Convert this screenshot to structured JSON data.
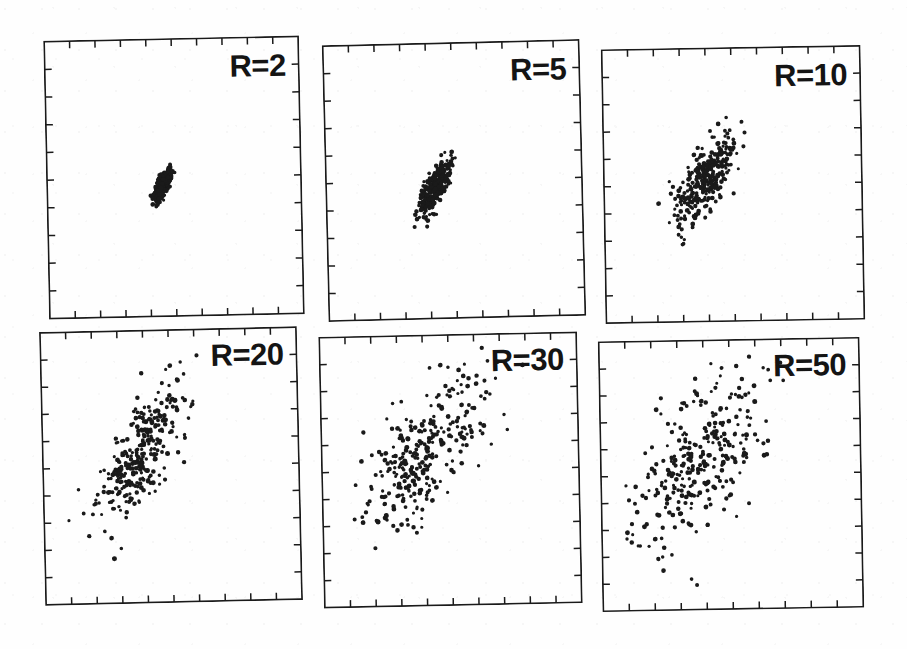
{
  "figure": {
    "title": "",
    "background_color": "#fefefe",
    "ink_color": "#1a1a1a",
    "width": 907,
    "height": 649,
    "rows": 2,
    "columns": 3
  },
  "chart_data": {
    "type": "scatter",
    "title": "",
    "xlabel": "",
    "ylabel": "",
    "grid": false,
    "legend": null,
    "axis_ticks": {
      "x_interior_ticks": 9,
      "y_interior_ticks": 9,
      "tick_direction": "inward",
      "tick_labels": []
    },
    "xlim": [
      0,
      1
    ],
    "ylim": [
      0,
      1
    ],
    "panel_note": "Each panel shows a bivariate correlated cloud of ~300 points centred near the middle of the frame; the scatter spread grows with R while the positive correlation (elongation along the lower-left to upper-right diagonal) is preserved.",
    "panels": [
      {
        "id": "panel-r2",
        "label": "R=2",
        "R": 2,
        "n_points": 300,
        "center": [
          0.455,
          0.47
        ],
        "sigma_x": 0.016,
        "sigma_y": 0.026,
        "correlation": 0.72,
        "tilt_deg": -1.2
      },
      {
        "id": "panel-r5",
        "label": "R=5",
        "R": 5,
        "n_points": 300,
        "center": [
          0.43,
          0.48
        ],
        "sigma_x": 0.033,
        "sigma_y": 0.052,
        "correlation": 0.74,
        "tilt_deg": -1.4
      },
      {
        "id": "panel-r10",
        "label": "R=10",
        "R": 10,
        "n_points": 300,
        "center": [
          0.395,
          0.52
        ],
        "sigma_x": 0.062,
        "sigma_y": 0.085,
        "correlation": 0.76,
        "tilt_deg": -1.0
      },
      {
        "id": "panel-r20",
        "label": "R=20",
        "R": 20,
        "n_points": 300,
        "center": [
          0.38,
          0.545
        ],
        "sigma_x": 0.093,
        "sigma_y": 0.12,
        "correlation": 0.74,
        "tilt_deg": -1.3
      },
      {
        "id": "panel-r30",
        "label": "R=30",
        "R": 30,
        "n_points": 300,
        "center": [
          0.395,
          0.555
        ],
        "sigma_x": 0.118,
        "sigma_y": 0.145,
        "correlation": 0.66,
        "tilt_deg": -1.2
      },
      {
        "id": "panel-r50",
        "label": "R=50",
        "R": 50,
        "n_points": 300,
        "center": [
          0.385,
          0.565
        ],
        "sigma_x": 0.145,
        "sigma_y": 0.175,
        "correlation": 0.64,
        "tilt_deg": -1.0
      }
    ]
  },
  "layout": {
    "panel_boxes": [
      {
        "left": 46,
        "top": 38,
        "width": 256,
        "height": 279
      },
      {
        "left": 325,
        "top": 42,
        "width": 258,
        "height": 277
      },
      {
        "left": 603,
        "top": 47,
        "width": 260,
        "height": 275
      },
      {
        "left": 42,
        "top": 329,
        "width": 258,
        "height": 274
      },
      {
        "left": 321,
        "top": 334,
        "width": 259,
        "height": 272
      },
      {
        "left": 600,
        "top": 339,
        "width": 262,
        "height": 271
      }
    ],
    "label_offsets": [
      {
        "right": 14,
        "top": 14
      },
      {
        "right": 14,
        "top": 14
      },
      {
        "right": 14,
        "top": 14
      },
      {
        "right": 14,
        "top": 12
      },
      {
        "right": 14,
        "top": 12
      },
      {
        "right": 14,
        "top": 12
      }
    ]
  }
}
